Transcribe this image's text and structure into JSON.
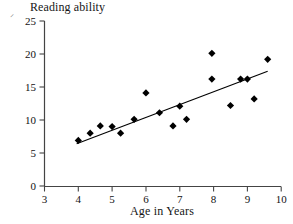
{
  "chart_data": {
    "type": "scatter",
    "title": "Reading ability",
    "xlabel": "Age in Years",
    "ylabel": "",
    "corner_mark": "⸍",
    "xlim": [
      3,
      10
    ],
    "ylim": [
      0,
      25
    ],
    "xticks": [
      3,
      4,
      5,
      6,
      7,
      8,
      9,
      10
    ],
    "yticks": [
      0,
      5,
      10,
      15,
      20,
      25
    ],
    "xtick_labels": [
      "3",
      "4",
      "5",
      "6",
      "7",
      "8",
      "9",
      "10"
    ],
    "ytick_labels": [
      "0",
      "5",
      "10",
      "15",
      "20",
      "25"
    ],
    "grid": false,
    "legend": null,
    "marker": "diamond",
    "marker_color": "#000000",
    "line_color": "#000000",
    "points": [
      {
        "x": 4.0,
        "y": 6.9
      },
      {
        "x": 4.35,
        "y": 8.0
      },
      {
        "x": 4.65,
        "y": 9.1
      },
      {
        "x": 5.0,
        "y": 9.0
      },
      {
        "x": 5.25,
        "y": 8.0
      },
      {
        "x": 5.65,
        "y": 10.1
      },
      {
        "x": 6.0,
        "y": 14.1
      },
      {
        "x": 6.4,
        "y": 11.1
      },
      {
        "x": 6.8,
        "y": 9.1
      },
      {
        "x": 7.0,
        "y": 12.1
      },
      {
        "x": 7.2,
        "y": 10.1
      },
      {
        "x": 7.95,
        "y": 20.1
      },
      {
        "x": 7.95,
        "y": 16.2
      },
      {
        "x": 8.5,
        "y": 12.2
      },
      {
        "x": 8.8,
        "y": 16.2
      },
      {
        "x": 9.0,
        "y": 16.2
      },
      {
        "x": 9.2,
        "y": 13.2
      },
      {
        "x": 9.6,
        "y": 19.2
      }
    ],
    "trendline": {
      "x_start": 3.95,
      "y_start": 6.4,
      "x_end": 9.6,
      "y_end": 17.4
    }
  }
}
